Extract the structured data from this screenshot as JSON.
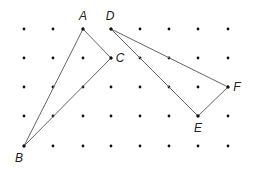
{
  "diagram": {
    "type": "dot-grid-geometry",
    "grid": {
      "columns_x": [
        24,
        53,
        83,
        111,
        140,
        169,
        198,
        228
      ],
      "rows_y": [
        29,
        58,
        87,
        116,
        146
      ],
      "dot_color": "#111111"
    },
    "points": [
      {
        "name": "A",
        "col": 2,
        "row": 0,
        "label_dx": 0,
        "label_dy": -9
      },
      {
        "name": "B",
        "col": 0,
        "row": 4,
        "label_dx": -5,
        "label_dy": 16
      },
      {
        "name": "C",
        "col": 3,
        "row": 1,
        "label_dx": 9,
        "label_dy": 4
      },
      {
        "name": "D",
        "col": 3,
        "row": 0,
        "label_dx": -1,
        "label_dy": -9
      },
      {
        "name": "E",
        "col": 6,
        "row": 3,
        "label_dx": 0,
        "label_dy": 16
      },
      {
        "name": "F",
        "col": 7,
        "row": 2,
        "label_dx": 9,
        "label_dy": 4
      }
    ],
    "triangles": [
      {
        "name": "ABC",
        "vertices": [
          "A",
          "B",
          "C"
        ]
      },
      {
        "name": "DEF",
        "vertices": [
          "D",
          "E",
          "F"
        ]
      }
    ],
    "line_color": "#666666"
  }
}
